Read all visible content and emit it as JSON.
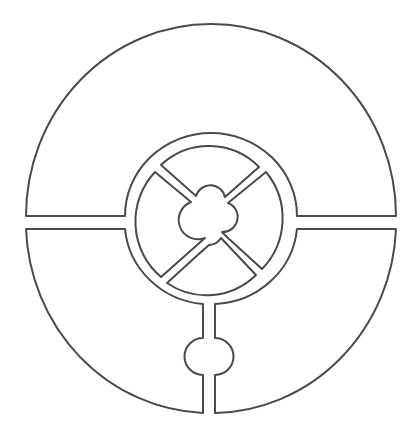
{
  "diagram": {
    "title": "",
    "stroke_color": "#4a4a4a",
    "background": "#ffffff",
    "elements": [
      {
        "name": "outer-disc",
        "shape": "circle",
        "split_by": "horizontal slot"
      },
      {
        "name": "inner-ring",
        "shape": "ring"
      },
      {
        "name": "cross-spokes",
        "shape": "x",
        "count": 2
      },
      {
        "name": "center-hub",
        "shape": "circle"
      },
      {
        "name": "bottom-channel",
        "shape": "slot with round bulb"
      }
    ]
  }
}
